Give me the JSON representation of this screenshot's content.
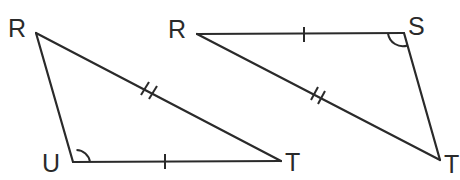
{
  "diagram": {
    "type": "geometry-congruent-triangles",
    "triangles": [
      {
        "id": "triangle-rut",
        "vertices": [
          {
            "label": "R",
            "x": 36,
            "y": 33,
            "label_x": 8,
            "label_y": 37
          },
          {
            "label": "U",
            "x": 73,
            "y": 162,
            "label_x": 42,
            "label_y": 172
          },
          {
            "label": "T",
            "x": 281,
            "y": 161,
            "label_x": 285,
            "label_y": 171
          }
        ],
        "angle_mark": {
          "at": "U",
          "type": "single-arc"
        },
        "tick_marks": [
          {
            "side": "UT",
            "count": 1
          },
          {
            "side": "RT",
            "count": 2
          }
        ]
      },
      {
        "id": "triangle-rst",
        "vertices": [
          {
            "label": "R",
            "x": 197,
            "y": 34,
            "label_x": 168,
            "label_y": 38
          },
          {
            "label": "S",
            "x": 404,
            "y": 33,
            "label_x": 408,
            "label_y": 35
          },
          {
            "label": "T",
            "x": 440,
            "y": 160,
            "label_x": 444,
            "label_y": 173
          }
        ],
        "angle_mark": {
          "at": "S",
          "type": "single-arc"
        },
        "tick_marks": [
          {
            "side": "RS",
            "count": 1
          },
          {
            "side": "RT",
            "count": 2
          }
        ]
      }
    ],
    "colors": {
      "stroke": "#2a2a2a",
      "background": "#ffffff"
    }
  },
  "labels": {
    "t1_R": "R",
    "t1_U": "U",
    "t1_T": "T",
    "t2_R": "R",
    "t2_S": "S",
    "t2_T": "T"
  }
}
